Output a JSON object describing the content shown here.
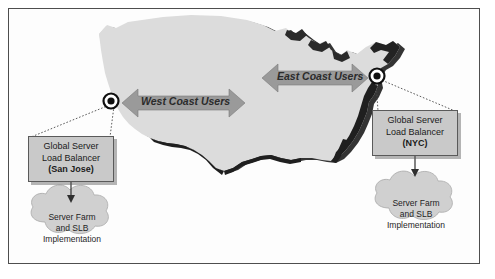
{
  "figure": {
    "background_color": "#ffffff",
    "frame_color": "#4e4e4e"
  },
  "map": {
    "name": "united-states-silhouette",
    "fill_color": "#dcdcdc",
    "shadow_color": "#232323"
  },
  "traffic_bands": [
    {
      "id": "west",
      "label": "West Coast Users",
      "direction": "bidirectional",
      "color": "#9a9a9a"
    },
    {
      "id": "east",
      "label": "East Coast Users",
      "direction": "bidirectional",
      "color": "#9a9a9a"
    }
  ],
  "nodes": [
    {
      "id": "node-west",
      "name": "san-jose-node",
      "marker": "concentric-circle"
    },
    {
      "id": "node-east",
      "name": "nyc-node",
      "marker": "concentric-circle"
    }
  ],
  "callouts": [
    {
      "id": "west",
      "line1": "Global Server",
      "line2": "Load Balancer",
      "city": "(San Jose)",
      "fill_color": "#c9c9c9"
    },
    {
      "id": "east",
      "line1": "Global Server",
      "line2": "Load Balancer",
      "city": "(NYC)",
      "fill_color": "#c9c9c9"
    }
  ],
  "clouds": [
    {
      "id": "west",
      "line1": "Server Farm",
      "line2": "and SLB",
      "line3": "Implementation",
      "fill_color": "#d0d0d0"
    },
    {
      "id": "east",
      "line1": "Server Farm",
      "line2": "and SLB",
      "line3": "Implementation",
      "fill_color": "#d0d0d0"
    }
  ]
}
